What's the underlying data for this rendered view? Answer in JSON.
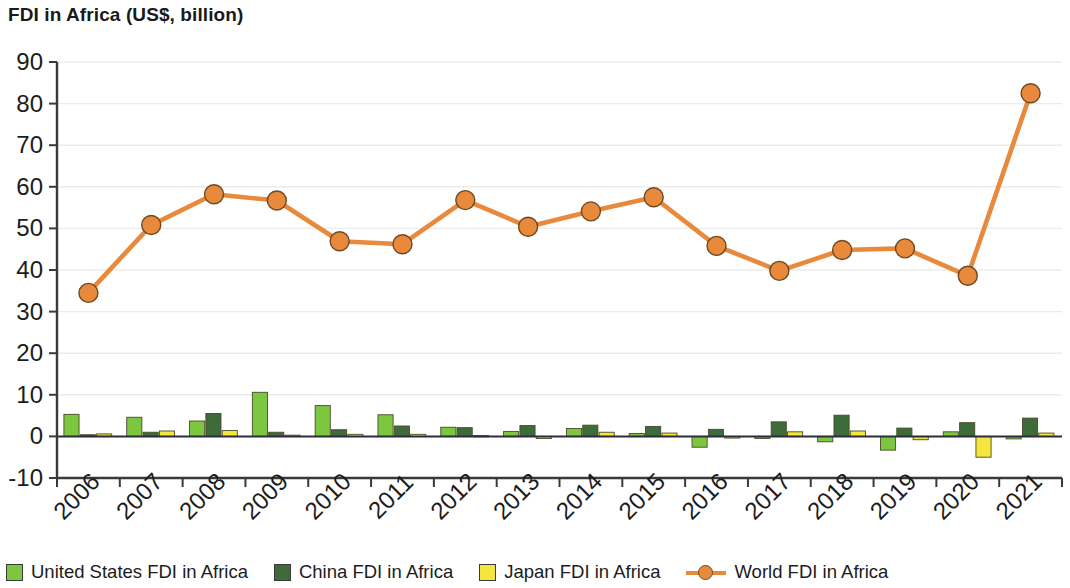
{
  "chart_data": {
    "type": "bar",
    "title": "FDI in Africa (US$, billion)",
    "xlabel": "",
    "ylabel": "",
    "ylim": [
      -10,
      90
    ],
    "ytick_step": 10,
    "yticks": [
      "90",
      "80",
      "70",
      "60",
      "50",
      "40",
      "30",
      "20",
      "10",
      "0",
      "-10"
    ],
    "grid": true,
    "legend_position": "bottom",
    "categories": [
      "2006",
      "2007",
      "2008",
      "2009",
      "2010",
      "2011",
      "2012",
      "2013",
      "2014",
      "2015",
      "2016",
      "2017",
      "2018",
      "2019",
      "2020",
      "2021"
    ],
    "series": [
      {
        "name": "United States FDI in Africa",
        "type": "bar",
        "color": "#7dc63f",
        "values": [
          5.3,
          4.6,
          3.7,
          10.6,
          7.4,
          5.2,
          2.2,
          1.2,
          1.9,
          0.7,
          -2.6,
          -0.5,
          -1.3,
          -3.3,
          1.1,
          -0.6
        ]
      },
      {
        "name": "China FDI in Africa",
        "type": "bar",
        "color": "#3d6b3a",
        "values": [
          0.4,
          1.0,
          5.5,
          1.0,
          1.6,
          2.5,
          2.1,
          2.6,
          2.7,
          2.4,
          1.7,
          3.5,
          5.1,
          2.0,
          3.3,
          4.4
        ]
      },
      {
        "name": "Japan FDI in Africa",
        "type": "bar",
        "color": "#f5e game",
        "values": [
          0.6,
          1.3,
          1.4,
          0.3,
          0.5,
          0.5,
          0.2,
          -0.5,
          1.0,
          0.8,
          -0.4,
          1.1,
          1.3,
          -0.8,
          -5.0,
          0.8
        ]
      },
      {
        "name": "World FDI in Africa",
        "type": "line",
        "color": "#e8893c",
        "values": [
          34.5,
          50.8,
          58.2,
          56.7,
          46.9,
          46.2,
          56.8,
          50.4,
          54.1,
          57.5,
          45.8,
          39.8,
          44.8,
          45.2,
          38.6,
          82.5
        ]
      }
    ]
  },
  "legend": {
    "items": [
      {
        "label": "United States FDI in Africa",
        "marker": "square",
        "color": "#7dc63f"
      },
      {
        "label": "China FDI in Africa",
        "marker": "square",
        "color": "#3d6b3a"
      },
      {
        "label": "Japan FDI in Africa",
        "marker": "square",
        "color": "#f5e63d"
      },
      {
        "label": "World FDI in Africa",
        "marker": "line-circle",
        "color": "#e8893c"
      }
    ]
  },
  "colors": {
    "united_states": "#7dc63f",
    "china": "#3d6b3a",
    "japan": "#f5e63d",
    "world": "#e8893c",
    "axis": "#3a3a3a",
    "grid": "#ececed",
    "text": "#1c1c1c"
  }
}
